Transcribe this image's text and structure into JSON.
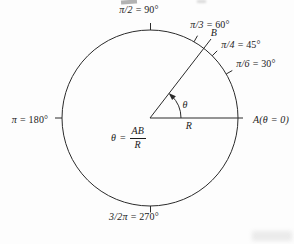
{
  "figure": {
    "angle_labels": [
      {
        "symbol": "π/2",
        "value": "= 90°"
      },
      {
        "symbol": "π/3",
        "value": "= 60°"
      },
      {
        "symbol": "π/4",
        "value": "= 45°"
      },
      {
        "symbol": "π/6",
        "value": "= 30°"
      },
      {
        "symbol": "π",
        "value": "= 180°"
      },
      {
        "symbol": "3/2π",
        "value": "= 270°"
      }
    ],
    "points": {
      "a": "A(θ = 0)",
      "b": "B"
    },
    "radius_label": "R",
    "angle_symbol": "θ",
    "formula": {
      "lhs": "θ",
      "equals": "=",
      "numerator": "AB",
      "denominator": "R"
    },
    "colors": {
      "line": "#2b2b2b",
      "text": "#1b1b1b",
      "background": "#fdfdfd"
    }
  }
}
